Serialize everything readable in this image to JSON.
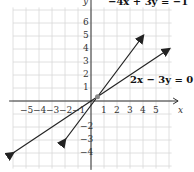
{
  "chart_data": {
    "type": "line",
    "title": "",
    "xlabel": "x",
    "ylabel": "y",
    "xlim": [
      -6,
      6
    ],
    "ylim": [
      -5,
      7
    ],
    "grid": true,
    "x_ticks": [
      "-5",
      "-4",
      "-3",
      "-2",
      "-1",
      "1",
      "2",
      "3",
      "4",
      "5"
    ],
    "y_ticks": [
      "6",
      "5",
      "4",
      "3",
      "2",
      "1",
      "-2",
      "-3",
      "-4"
    ],
    "series": [
      {
        "name": "-4x + 3y = -1",
        "label": "−4x + 3y = −1",
        "points": [
          [
            -2,
            -3
          ],
          [
            4,
            5
          ]
        ]
      },
      {
        "name": "2x - 3y = 0",
        "label": "2x − 3y = 0",
        "points": [
          [
            -6,
            -4
          ],
          [
            6,
            4
          ]
        ]
      }
    ],
    "annotations": [
      {
        "text": "intersection",
        "x": 0.5,
        "y": 0.33
      }
    ]
  },
  "labels": {
    "eq1": "−4x + 3y = −1",
    "eq2": "2x − 3y = 0",
    "x_axis": "x",
    "y_axis": "y"
  }
}
